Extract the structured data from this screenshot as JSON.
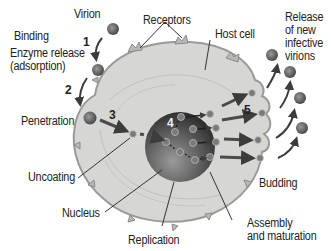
{
  "labels": {
    "virion": "Virion",
    "receptors": "Receptors",
    "host_cell": "Host cell",
    "release": [
      "Release",
      "of new",
      "infective",
      "virions"
    ],
    "binding": "Binding",
    "enzyme_release": "Enzyme release",
    "adsorption": "(adsorption)",
    "penetration": "Penetration",
    "uncoating": "Uncoating",
    "nucleus": "Nucleus",
    "replication": "Replication",
    "budding": "Budding",
    "assembly": [
      "Assembly",
      "and maturation"
    ]
  },
  "steps": {
    "s1": "1",
    "s2": "2",
    "s3": "3",
    "s4": "4",
    "s5": "5"
  },
  "colors": {
    "cell_fill": "#d6d6d2",
    "cell_edge": "#9a9a96",
    "nucleus_dark": "#3a3a3a",
    "nucleus_light": "#8a8a8a",
    "virion": "#6e6e6e",
    "arrow": "#3c3c3c"
  }
}
